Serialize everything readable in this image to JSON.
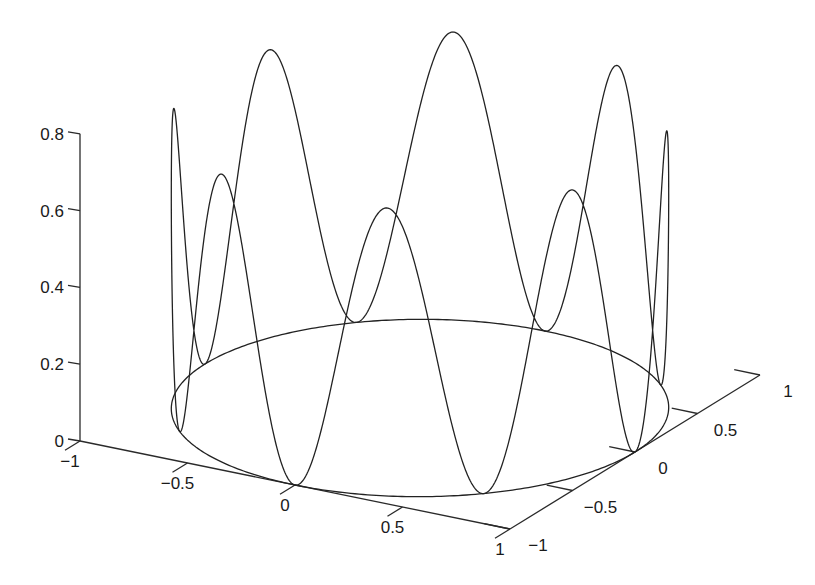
{
  "chart_data": {
    "type": "line3d",
    "title": "",
    "xlabel": "",
    "ylabel": "",
    "zlabel": "",
    "grid": false,
    "legend": null,
    "parametric": {
      "x": "cos(t)",
      "y": "sin(t)",
      "z": "0.75*sin(4t)^2",
      "t_range": [
        0,
        6.2832
      ],
      "z_amplitude": 0.75,
      "z_frequency": 4
    },
    "xlim": [
      -1,
      1
    ],
    "ylim": [
      -1,
      1
    ],
    "zlim": [
      0,
      0.8
    ],
    "x_ticks": [
      -1,
      -0.5,
      0,
      0.5,
      1
    ],
    "y_ticks": [
      -1,
      -0.5,
      0,
      0.5,
      1
    ],
    "z_ticks": [
      0,
      0.2,
      0.4,
      0.6,
      0.8
    ],
    "x_tick_labels": [
      "−1",
      "−0.5",
      "0",
      "0.5",
      "1"
    ],
    "y_tick_labels": [
      "−1",
      "−0.5",
      "0",
      "0.5",
      "1"
    ],
    "z_tick_labels": [
      "0",
      "0.2",
      "0.4",
      "0.6",
      "0.8"
    ],
    "curve_color": "#222222",
    "axis_color": "#2a2a2a"
  },
  "projection": {
    "origin_px": [
      80,
      441
    ],
    "x_vec_px": [
      430,
      88
    ],
    "y_vec_px": [
      250,
      -154
    ],
    "z_px_per_unit": 384
  }
}
